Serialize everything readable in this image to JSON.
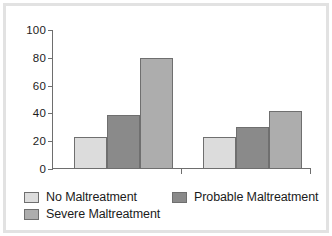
{
  "chart_data": {
    "type": "bar",
    "title": "",
    "xlabel": "",
    "ylabel": "",
    "ylim": [
      0,
      100
    ],
    "yticks": [
      0,
      20,
      40,
      60,
      80,
      100
    ],
    "ytick_labels": [
      "0",
      "20",
      "40",
      "60",
      "80",
      "100"
    ],
    "grid": false,
    "legend_position": "bottom-left",
    "categories": [
      "Group 1",
      "Group 2"
    ],
    "series": [
      {
        "name": "No Maltreatment",
        "color": "#dcdcdc",
        "values": [
          23,
          23
        ]
      },
      {
        "name": "Probable Maltreatment",
        "color": "#8a8a8a",
        "values": [
          39,
          30
        ]
      },
      {
        "name": "Severe Maltreatment",
        "color": "#adadad",
        "values": [
          80,
          42
        ]
      }
    ]
  },
  "legend": {
    "items": [
      {
        "label": "No Maltreatment",
        "color": "#dcdcdc"
      },
      {
        "label": "Probable Maltreatment",
        "color": "#8a8a8a"
      },
      {
        "label": "Severe Maltreatment",
        "color": "#adadad"
      }
    ]
  },
  "colors": {
    "frame_border": "#e2e2e2",
    "panel_background": "#ffffff",
    "axis": "#6e6e6e",
    "bar_outline": "#6f6f6f",
    "text": "#1c1c1c"
  }
}
